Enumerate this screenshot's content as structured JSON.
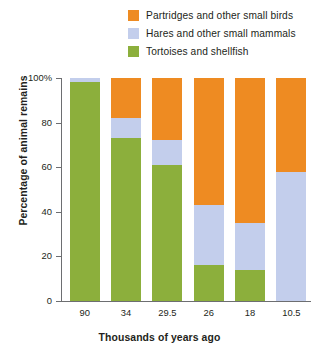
{
  "chart_data": {
    "type": "bar",
    "stacked": true,
    "title": "",
    "xlabel": "Thousands of years ago",
    "ylabel": "Percentage of animal remains",
    "categories": [
      "90",
      "34",
      "29.5",
      "26",
      "18",
      "10.5"
    ],
    "ylim": [
      0,
      100
    ],
    "yticks": [
      0,
      20,
      40,
      60,
      80,
      100
    ],
    "ytick_labels": [
      "0",
      "20",
      "40",
      "60",
      "80",
      "100%"
    ],
    "grid": false,
    "legend_position": "top-right",
    "series": [
      {
        "name": "Partridges and other small birds",
        "color": "#ee8b22",
        "values": [
          0,
          18,
          28,
          57,
          65,
          42
        ]
      },
      {
        "name": "Hares and other small mammals",
        "color": "#c3ceec",
        "values": [
          2,
          9,
          11,
          27,
          21,
          58
        ]
      },
      {
        "name": "Tortoises and shellfish",
        "color": "#8caf3c",
        "values": [
          98,
          73,
          61,
          16,
          14,
          0
        ]
      }
    ]
  },
  "legend": {
    "items": [
      {
        "label": "Partridges and other small birds",
        "color": "#ee8b22"
      },
      {
        "label": "Hares and other small mammals",
        "color": "#c3ceec"
      },
      {
        "label": "Tortoises and shellfish",
        "color": "#8caf3c"
      }
    ]
  },
  "axes": {
    "y_title": "Percentage of animal remains",
    "x_title": "Thousands of years ago",
    "y_labels": [
      "100%",
      "80",
      "60",
      "40",
      "20",
      "0"
    ],
    "x_labels": [
      "90",
      "34",
      "29.5",
      "26",
      "18",
      "10.5"
    ]
  }
}
